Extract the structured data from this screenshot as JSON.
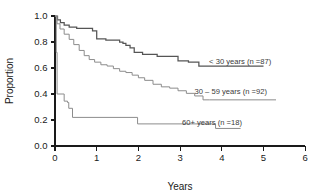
{
  "chart_data": {
    "type": "line",
    "subtype": "kaplan-meier-survival",
    "title": "",
    "xlabel": "Years",
    "ylabel": "Proportion",
    "xlim": [
      0,
      6
    ],
    "ylim": [
      0,
      1.0
    ],
    "xticks": [
      "0",
      "1",
      "2",
      "3",
      "4",
      "5",
      "6"
    ],
    "xtick_values": [
      0,
      1,
      2,
      3,
      4,
      5,
      6
    ],
    "yticks": [
      "0.0",
      "0.2",
      "0.4",
      "0.6",
      "0.8",
      "1.0"
    ],
    "ytick_values": [
      0.0,
      0.2,
      0.4,
      0.6,
      0.8,
      1.0
    ],
    "grid": false,
    "legend_position": "inline-annotations",
    "series": [
      {
        "name": "< 30 years (n =87)",
        "n": 87,
        "color": "#555555",
        "points": [
          [
            0.0,
            1.0
          ],
          [
            0.06,
            1.0
          ],
          [
            0.06,
            0.97
          ],
          [
            0.13,
            0.97
          ],
          [
            0.13,
            0.95
          ],
          [
            0.22,
            0.95
          ],
          [
            0.22,
            0.93
          ],
          [
            0.34,
            0.93
          ],
          [
            0.34,
            0.915
          ],
          [
            0.52,
            0.915
          ],
          [
            0.52,
            0.905
          ],
          [
            0.9,
            0.905
          ],
          [
            0.9,
            0.885
          ],
          [
            1.0,
            0.885
          ],
          [
            1.0,
            0.825
          ],
          [
            1.22,
            0.825
          ],
          [
            1.22,
            0.815
          ],
          [
            1.55,
            0.815
          ],
          [
            1.55,
            0.8
          ],
          [
            1.63,
            0.8
          ],
          [
            1.63,
            0.79
          ],
          [
            1.7,
            0.79
          ],
          [
            1.7,
            0.775
          ],
          [
            1.8,
            0.775
          ],
          [
            1.8,
            0.755
          ],
          [
            1.9,
            0.755
          ],
          [
            1.9,
            0.72
          ],
          [
            2.1,
            0.72
          ],
          [
            2.1,
            0.705
          ],
          [
            2.45,
            0.705
          ],
          [
            2.45,
            0.69
          ],
          [
            2.95,
            0.69
          ],
          [
            2.95,
            0.655
          ],
          [
            3.2,
            0.655
          ],
          [
            3.2,
            0.645
          ],
          [
            3.45,
            0.645
          ],
          [
            3.45,
            0.615
          ],
          [
            5.0,
            0.615
          ]
        ]
      },
      {
        "name": "30 – 59 years (n =92)",
        "n": 92,
        "color": "#8c8c8c",
        "points": [
          [
            0.0,
            1.0
          ],
          [
            0.05,
            1.0
          ],
          [
            0.05,
            0.94
          ],
          [
            0.12,
            0.94
          ],
          [
            0.12,
            0.9
          ],
          [
            0.22,
            0.9
          ],
          [
            0.22,
            0.86
          ],
          [
            0.34,
            0.86
          ],
          [
            0.34,
            0.82
          ],
          [
            0.45,
            0.82
          ],
          [
            0.45,
            0.78
          ],
          [
            0.58,
            0.78
          ],
          [
            0.58,
            0.735
          ],
          [
            0.7,
            0.735
          ],
          [
            0.7,
            0.695
          ],
          [
            0.82,
            0.695
          ],
          [
            0.82,
            0.665
          ],
          [
            0.95,
            0.665
          ],
          [
            0.95,
            0.645
          ],
          [
            1.1,
            0.645
          ],
          [
            1.1,
            0.625
          ],
          [
            1.25,
            0.625
          ],
          [
            1.25,
            0.615
          ],
          [
            1.4,
            0.615
          ],
          [
            1.4,
            0.595
          ],
          [
            1.55,
            0.595
          ],
          [
            1.55,
            0.575
          ],
          [
            1.7,
            0.575
          ],
          [
            1.7,
            0.565
          ],
          [
            1.85,
            0.565
          ],
          [
            1.85,
            0.545
          ],
          [
            2.0,
            0.545
          ],
          [
            2.0,
            0.525
          ],
          [
            2.15,
            0.525
          ],
          [
            2.15,
            0.505
          ],
          [
            2.35,
            0.505
          ],
          [
            2.35,
            0.475
          ],
          [
            2.55,
            0.475
          ],
          [
            2.55,
            0.455
          ],
          [
            2.75,
            0.455
          ],
          [
            2.75,
            0.445
          ],
          [
            2.95,
            0.445
          ],
          [
            2.95,
            0.425
          ],
          [
            3.15,
            0.425
          ],
          [
            3.15,
            0.405
          ],
          [
            3.35,
            0.405
          ],
          [
            3.35,
            0.385
          ],
          [
            3.55,
            0.385
          ],
          [
            3.55,
            0.355
          ],
          [
            3.7,
            0.355
          ],
          [
            5.3,
            0.355
          ]
        ]
      },
      {
        "name": "60+ years (n =18)",
        "n": 18,
        "color": "#8c8c8c",
        "points": [
          [
            0.0,
            1.0
          ],
          [
            0.03,
            1.0
          ],
          [
            0.03,
            0.72
          ],
          [
            0.05,
            0.72
          ],
          [
            0.05,
            0.4
          ],
          [
            0.22,
            0.4
          ],
          [
            0.22,
            0.345
          ],
          [
            0.3,
            0.345
          ],
          [
            0.3,
            0.335
          ],
          [
            0.33,
            0.335
          ],
          [
            0.33,
            0.29
          ],
          [
            0.42,
            0.29
          ],
          [
            0.42,
            0.22
          ],
          [
            1.98,
            0.22
          ],
          [
            1.98,
            0.17
          ],
          [
            3.85,
            0.17
          ],
          [
            3.85,
            0.135
          ],
          [
            4.45,
            0.135
          ]
        ]
      }
    ],
    "annotations": [
      {
        "id": "label-under30",
        "text": "< 30 years (n =87)",
        "x_years": 3.6,
        "y_prop": 0.655,
        "leader_color": "#8c8c8c"
      },
      {
        "id": "label-30to59",
        "text": "30 – 59 years (n =92)",
        "x_years": 3.25,
        "y_prop": 0.425,
        "leader_color": "#8c8c8c"
      },
      {
        "id": "label-60plus",
        "text": "60+ years (n =18)",
        "x_years": 2.95,
        "y_prop": 0.185,
        "leader_color": "#8c8c8c"
      }
    ]
  },
  "axes": {
    "x_title": "Years",
    "y_title": "Proportion"
  }
}
